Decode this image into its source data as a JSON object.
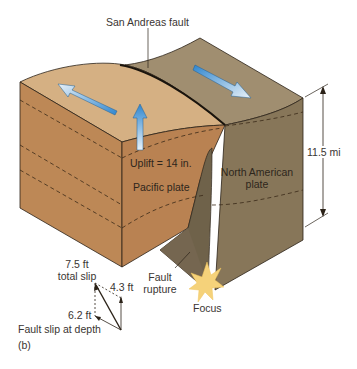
{
  "figure": {
    "panel_label": "(b)",
    "labels": {
      "fault_name": "San Andreas fault",
      "uplift": "Uplift = 14 in.",
      "pacific_plate": "Pacific plate",
      "north_american_plate_line1": "North American",
      "north_american_plate_line2": "plate",
      "depth": "11.5 mi",
      "total_slip_value": "7.5 ft",
      "total_slip_label": "total slip",
      "vertical_component": "4.3 ft",
      "horizontal_component": "6.2 ft",
      "fault_slip_at_depth": "Fault slip at depth",
      "fault_rupture_line1": "Fault",
      "fault_rupture_line2": "rupture",
      "focus": "Focus"
    },
    "colors": {
      "pacific_top": "#d3ac7c",
      "pacific_front": "#b9834f",
      "pacific_side": "#c08c58",
      "north_american_top": "#9c8a6c",
      "north_american_side": "#857459",
      "fault_rupture_surface": "#6d6048",
      "arrow_blue": "#3d8fd0",
      "focus_star": "#f6d37a",
      "outline": "#2b2218"
    },
    "arrows": [
      "pacific-plate-motion-northwest",
      "north-american-plate-motion-southeast",
      "uplift-arrow"
    ]
  }
}
